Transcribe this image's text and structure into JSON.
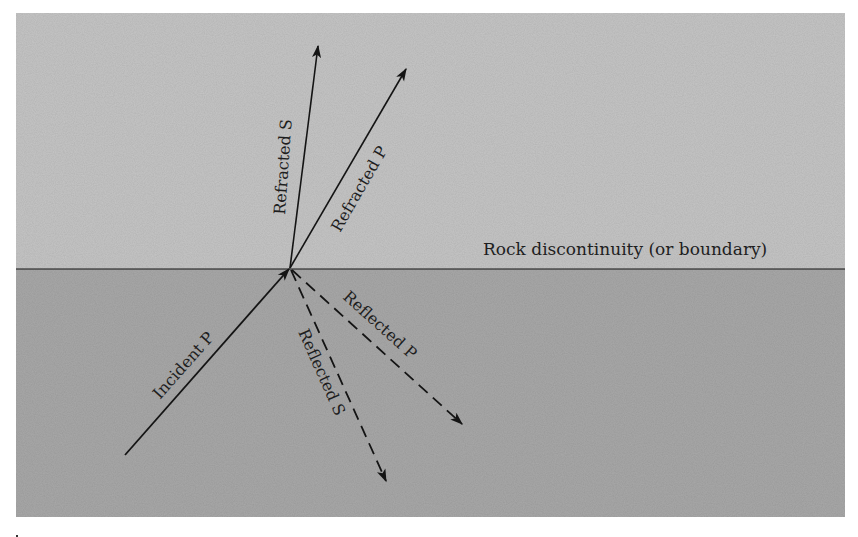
{
  "diagram": {
    "colors": {
      "upper_layer": "#c6c6c6",
      "lower_layer": "#a9a9a9",
      "line": "#141414",
      "text": "#1e1e1e",
      "background": "#ffffff"
    },
    "boundary_label": "Rock discontinuity (or boundary)",
    "rays": {
      "refracted_s": {
        "label": "Refracted S",
        "style": "solid"
      },
      "refracted_p": {
        "label": "Refracted P",
        "style": "solid"
      },
      "incident_p": {
        "label": "Incident P",
        "style": "solid"
      },
      "reflected_s": {
        "label": "Reflected S",
        "style": "dashed"
      },
      "reflected_p": {
        "label": "Reflected P",
        "style": "dashed"
      }
    }
  }
}
